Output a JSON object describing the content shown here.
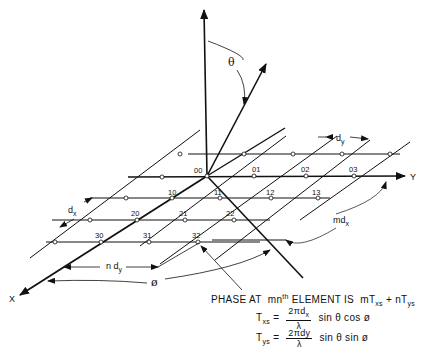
{
  "diagram": {
    "axes": {
      "x_label": "X",
      "y_label": "Y"
    },
    "angles": {
      "theta": "θ",
      "phi": "ø"
    },
    "spacing_labels": {
      "dx": "d",
      "dx_sub": "x",
      "dy": "d",
      "dy_sub": "y",
      "ndy": "n d",
      "ndy_sub": "y",
      "mdx": "md",
      "mdx_sub": "x"
    },
    "elements": [
      {
        "id": "00",
        "label": "00"
      },
      {
        "id": "01",
        "label": "01"
      },
      {
        "id": "02",
        "label": "02"
      },
      {
        "id": "03",
        "label": "03"
      },
      {
        "id": "10",
        "label": "10"
      },
      {
        "id": "11",
        "label": "11"
      },
      {
        "id": "12",
        "label": "12"
      },
      {
        "id": "13",
        "label": "13"
      },
      {
        "id": "20",
        "label": "20"
      },
      {
        "id": "21",
        "label": "21"
      },
      {
        "id": "22",
        "label": "22"
      },
      {
        "id": "30",
        "label": "30"
      },
      {
        "id": "31",
        "label": "31"
      },
      {
        "id": "32",
        "label": "32"
      }
    ]
  },
  "formula": {
    "line1_prefix": "PHASE AT",
    "line1_mn": "mn",
    "line1_th": "th",
    "line1_rest": "ELEMENT IS",
    "line1_expr_m": "mT",
    "line1_expr_m_sub": "xs",
    "line1_plus": "+",
    "line1_expr_n": "nT",
    "line1_expr_n_sub": "ys",
    "txs_lhs": "T",
    "txs_lhs_sub": "xs",
    "txs_eq": "=",
    "txs_num": "2πd",
    "txs_num_sub": "x",
    "txs_den": "λ",
    "txs_rhs": "sin θ  cos ø",
    "tys_lhs": "T",
    "tys_lhs_sub": "ys",
    "tys_eq": "=",
    "tys_num": "2πdy",
    "tys_den": "λ",
    "tys_rhs": "sin θ  sin ø"
  }
}
